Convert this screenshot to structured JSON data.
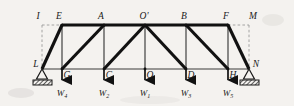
{
  "figure": {
    "type": "truss-diagram",
    "background_color": "#f4f2ef",
    "line_color": "#1a1a1a",
    "dashed_color": "#9a9a9a",
    "width": 294,
    "height": 106
  },
  "labels": {
    "I": "I",
    "E": "E",
    "A": "A",
    "O_prime": "O'",
    "B": "B",
    "F": "F",
    "M": "M",
    "L": "L",
    "G": "G",
    "C": "C",
    "O": "O",
    "D": "D",
    "H": "H",
    "N": "N"
  },
  "loads": [
    {
      "label": "W",
      "subscript": "4",
      "node": "G"
    },
    {
      "label": "W",
      "subscript": "2",
      "node": "C"
    },
    {
      "label": "W",
      "subscript": "1",
      "node": "O"
    },
    {
      "label": "W",
      "subscript": "3",
      "node": "D"
    },
    {
      "label": "W",
      "subscript": "5",
      "node": "H"
    }
  ],
  "nodes": {
    "top": [
      {
        "name": "I",
        "x": 42,
        "y": 25,
        "virtual": true
      },
      {
        "name": "E",
        "x": 62,
        "y": 25,
        "virtual": false
      },
      {
        "name": "A",
        "x": 104,
        "y": 25,
        "virtual": false
      },
      {
        "name": "O_prime",
        "x": 145,
        "y": 25,
        "virtual": false
      },
      {
        "name": "B",
        "x": 186,
        "y": 25,
        "virtual": false
      },
      {
        "name": "F",
        "x": 228,
        "y": 25,
        "virtual": false
      },
      {
        "name": "M",
        "x": 249,
        "y": 25,
        "virtual": true
      }
    ],
    "bottom": [
      {
        "name": "L",
        "x": 42,
        "y": 69
      },
      {
        "name": "G",
        "x": 62,
        "y": 69
      },
      {
        "name": "C",
        "x": 104,
        "y": 69
      },
      {
        "name": "O",
        "x": 145,
        "y": 69
      },
      {
        "name": "D",
        "x": 186,
        "y": 69
      },
      {
        "name": "H",
        "x": 228,
        "y": 69
      },
      {
        "name": "N",
        "x": 249,
        "y": 69
      }
    ]
  },
  "supports": [
    {
      "node": "L",
      "kind": "hatched-triangle"
    },
    {
      "node": "N",
      "kind": "hatched-triangle"
    }
  ]
}
